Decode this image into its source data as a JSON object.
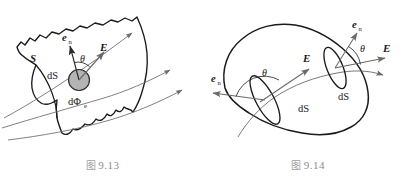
{
  "page": {
    "background_color": "#ffffff",
    "width": 411,
    "height": 178,
    "ink_color": "#1a1a1a",
    "field_line_color": "#5a5a5a",
    "patch_fill": "#b0b0b0",
    "caption_color": "#8e8e8e"
  },
  "figures": [
    {
      "id": "fig-9-13",
      "caption_cjk": "图",
      "caption_number": "9.13",
      "caption_full": "图 9.13",
      "description": "Open curved surface S with an element dS, normal unit vector e_n, field E at angle theta, flux dPhi_e",
      "labels": {
        "surface": "S",
        "area_element": "dS",
        "normal_vector": "e",
        "normal_subscript": "n",
        "angle": "θ",
        "field_vector": "E",
        "flux": "dΦ",
        "flux_subscript": "e"
      },
      "field_line_count": 3
    },
    {
      "id": "fig-9-14",
      "caption_cjk": "图",
      "caption_number": "9.14",
      "caption_full": "图 9.14",
      "description": "Closed surface (blob) pierced by a field line, with two area elements dS showing entering and exiting flux",
      "labels": {
        "area_element_entry": "dS",
        "area_element_exit": "dS",
        "normal_vector_entry": "e",
        "normal_subscript_entry": "n",
        "normal_vector_exit": "e",
        "normal_subscript_exit": "n",
        "angle_entry": "θ",
        "angle_exit": "θ",
        "field_vector_entry": "E",
        "field_vector_exit": "E"
      },
      "field_line_count": 1
    }
  ]
}
